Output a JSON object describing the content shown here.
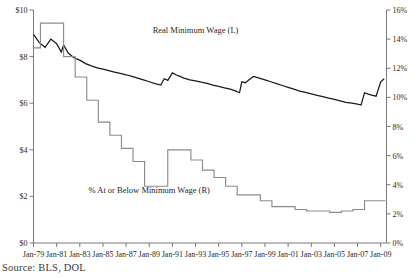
{
  "chart_data": {
    "type": "line",
    "title": "",
    "subtitle": "",
    "xlabel": "",
    "grid": false,
    "legend_position": "inline-annotation",
    "source": "Source: BLS, DOL",
    "x_axis": {
      "tick_labels": [
        "Jan-79",
        "Jan-81",
        "Jan-83",
        "Jan-85",
        "Jan-87",
        "Jan-89",
        "Jan-91",
        "Jan-93",
        "Jan-95",
        "Jan-97",
        "Jan-99",
        "Jan-01",
        "Jan-03",
        "Jan-05",
        "Jan-07",
        "Jan-09"
      ],
      "range": [
        1979,
        2009.5
      ],
      "tick_step_years": 2
    },
    "y_axis_left": {
      "label": "Real Minimum Wage (L)",
      "tick_labels": [
        "$0",
        "$2",
        "$4",
        "$6",
        "$8",
        "$10"
      ],
      "tick_values": [
        0,
        2,
        4,
        6,
        8,
        10
      ],
      "ylim": [
        0,
        10
      ],
      "units": "USD"
    },
    "y_axis_right": {
      "label": "% At or Below Minimum Wage (R)",
      "tick_labels": [
        "0%",
        "2%",
        "4%",
        "6%",
        "8%",
        "10%",
        "12%",
        "14%",
        "16%"
      ],
      "tick_values": [
        0,
        2,
        4,
        6,
        8,
        10,
        12,
        14,
        16
      ],
      "ylim": [
        0,
        16
      ],
      "units": "percent"
    },
    "annotations": [
      {
        "text": "Real Minimum Wage (L)",
        "x": 1993.0,
        "y_left": 9.0
      },
      {
        "text": "% At or Below Minimum Wage (R)",
        "x": 1989.0,
        "y_right": 3.4
      }
    ],
    "series": [
      {
        "name": "Real Minimum Wage (L)",
        "axis": "left",
        "color": "#1b1b1b",
        "style": "jagged-line",
        "x": [
          1979.0,
          1979.5,
          1980.0,
          1980.5,
          1981.0,
          1981.4,
          1981.6,
          1982.0,
          1982.5,
          1983.0,
          1983.5,
          1984.0,
          1984.5,
          1985.0,
          1985.5,
          1986.0,
          1986.5,
          1987.0,
          1987.5,
          1988.0,
          1988.5,
          1989.0,
          1989.5,
          1990.0,
          1990.3,
          1990.6,
          1991.0,
          1991.3,
          1991.6,
          1992.0,
          1992.5,
          1993.0,
          1993.5,
          1994.0,
          1994.5,
          1995.0,
          1995.5,
          1996.0,
          1996.5,
          1996.8,
          1997.0,
          1997.3,
          1997.6,
          1998.0,
          1998.5,
          1999.0,
          1999.5,
          2000.0,
          2000.5,
          2001.0,
          2001.5,
          2002.0,
          2002.5,
          2003.0,
          2003.5,
          2004.0,
          2004.5,
          2005.0,
          2005.5,
          2006.0,
          2006.5,
          2007.0,
          2007.3,
          2007.6,
          2008.0,
          2008.3,
          2008.6,
          2009.0,
          2009.3
        ],
        "y": [
          8.95,
          8.6,
          8.4,
          8.75,
          8.55,
          8.2,
          8.5,
          8.15,
          7.95,
          7.85,
          7.7,
          7.6,
          7.52,
          7.46,
          7.4,
          7.33,
          7.28,
          7.22,
          7.15,
          7.08,
          7.0,
          6.92,
          6.84,
          6.78,
          7.05,
          6.98,
          7.3,
          7.22,
          7.16,
          7.08,
          7.0,
          6.96,
          6.9,
          6.85,
          6.78,
          6.72,
          6.66,
          6.6,
          6.52,
          6.45,
          6.92,
          6.88,
          7.0,
          7.15,
          7.08,
          7.0,
          6.92,
          6.84,
          6.76,
          6.68,
          6.6,
          6.52,
          6.46,
          6.4,
          6.34,
          6.28,
          6.22,
          6.16,
          6.1,
          6.04,
          6.0,
          5.96,
          5.92,
          6.45,
          6.38,
          6.34,
          6.3,
          6.92,
          7.05
        ]
      },
      {
        "name": "% At or Below Minimum Wage (R)",
        "axis": "right",
        "color": "#8c8c8c",
        "style": "step-line",
        "x": [
          1979.0,
          1979.6,
          1979.6,
          1980.6,
          1980.6,
          1981.6,
          1981.6,
          1982.6,
          1982.6,
          1983.6,
          1983.6,
          1984.6,
          1984.6,
          1985.6,
          1985.6,
          1986.6,
          1986.6,
          1987.6,
          1987.6,
          1988.6,
          1988.6,
          1989.6,
          1989.6,
          1990.6,
          1990.6,
          1991.6,
          1991.6,
          1992.6,
          1992.6,
          1993.6,
          1993.6,
          1994.6,
          1994.6,
          1995.6,
          1995.6,
          1996.6,
          1996.6,
          1997.6,
          1997.6,
          1998.6,
          1998.6,
          1999.6,
          1999.6,
          2000.6,
          2000.6,
          2001.6,
          2001.6,
          2002.6,
          2002.6,
          2003.6,
          2003.6,
          2004.6,
          2004.6,
          2005.6,
          2005.6,
          2006.6,
          2006.6,
          2007.6,
          2007.6,
          2008.6,
          2008.6,
          2009.4
        ],
        "y": [
          13.4,
          13.4,
          15.1,
          15.1,
          15.1,
          15.1,
          12.8,
          12.8,
          11.4,
          11.4,
          9.8,
          9.8,
          8.3,
          8.3,
          7.4,
          7.4,
          6.5,
          6.5,
          5.6,
          5.6,
          3.9,
          3.9,
          3.9,
          3.9,
          6.4,
          6.4,
          6.4,
          6.4,
          5.7,
          5.7,
          5.0,
          5.0,
          4.5,
          4.5,
          3.9,
          3.9,
          3.3,
          3.3,
          3.3,
          3.3,
          2.9,
          2.9,
          2.5,
          2.5,
          2.5,
          2.5,
          2.3,
          2.3,
          2.2,
          2.2,
          2.2,
          2.2,
          2.1,
          2.1,
          2.2,
          2.2,
          2.3,
          2.3,
          2.9,
          2.9,
          2.9,
          2.9
        ]
      }
    ]
  }
}
